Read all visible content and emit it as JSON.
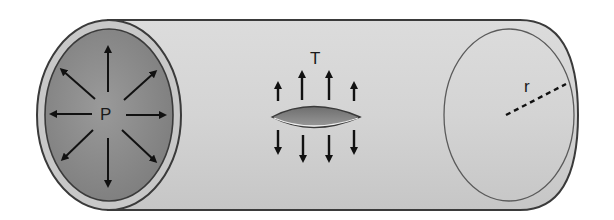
{
  "diagram": {
    "type": "pipe-pressure-tension",
    "labels": {
      "pressure": "P",
      "tension": "T",
      "radius": "r"
    },
    "colors": {
      "cylinder_body": "#d2d2d2",
      "cylinder_end_inner": "#8a8a8a",
      "cylinder_end_rim": "#c8c8c8",
      "outline": "#3a3a3a",
      "arrow": "#111111",
      "lens_fill": "#7d7d7d",
      "background": "#ffffff"
    },
    "pressure_arrows": 8,
    "tension_arrows_up": 4,
    "tension_arrows_down": 4
  }
}
